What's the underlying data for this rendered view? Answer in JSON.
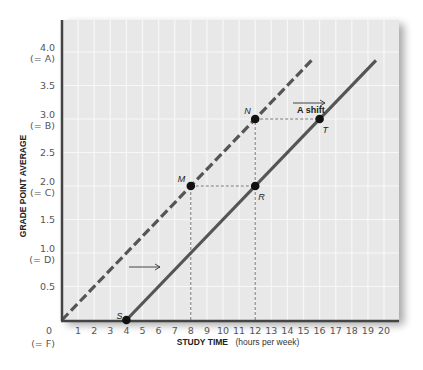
{
  "chart_data": {
    "type": "line",
    "title": "",
    "xlabel": "STUDY TIME",
    "xlabel_units": "(hours per week)",
    "ylabel": "GRADE POINT AVERAGE",
    "xlim": [
      0,
      21
    ],
    "ylim": [
      0,
      4.3
    ],
    "x_ticks": [
      1,
      2,
      3,
      4,
      5,
      6,
      7,
      8,
      9,
      10,
      11,
      12,
      13,
      14,
      15,
      16,
      17,
      18,
      19,
      20
    ],
    "y_ticks": [
      {
        "value": 0,
        "label": "0",
        "sub": "(= F)"
      },
      {
        "value": 0.5,
        "label": "0.5",
        "sub": ""
      },
      {
        "value": 1.0,
        "label": "1.0",
        "sub": "(= D)"
      },
      {
        "value": 1.5,
        "label": "1.5",
        "sub": ""
      },
      {
        "value": 2.0,
        "label": "2.0",
        "sub": "(= C)"
      },
      {
        "value": 2.5,
        "label": "2.5",
        "sub": ""
      },
      {
        "value": 3.0,
        "label": "3.0",
        "sub": "(= B)"
      },
      {
        "value": 3.5,
        "label": "3.5",
        "sub": ""
      },
      {
        "value": 4.0,
        "label": "4.0",
        "sub": "(= A)"
      }
    ],
    "grid": true,
    "series": [
      {
        "name": "Original relationship",
        "style": "dashed",
        "x": [
          0,
          15.5
        ],
        "y": [
          0,
          3.875
        ]
      },
      {
        "name": "Shifted relationship",
        "style": "solid",
        "x": [
          4,
          19.5
        ],
        "y": [
          0,
          3.875
        ]
      }
    ],
    "points": [
      {
        "label": "S",
        "x": 4,
        "y": 0
      },
      {
        "label": "M",
        "x": 8,
        "y": 2.0
      },
      {
        "label": "N",
        "x": 12,
        "y": 3.0
      },
      {
        "label": "R",
        "x": 12,
        "y": 2.0
      },
      {
        "label": "T",
        "x": 16,
        "y": 3.0
      }
    ],
    "annotations": [
      {
        "text": "A shift",
        "x": 14,
        "y": 3.15,
        "arrow": "right"
      },
      {
        "text": "",
        "x": 5.5,
        "y": 0.75,
        "arrow": "right"
      }
    ],
    "colors": {
      "plot_bg": "#e8e8e8",
      "grid": "#f7f7f7",
      "line": "#555555",
      "axis": "#444444",
      "point": "#111111"
    }
  }
}
